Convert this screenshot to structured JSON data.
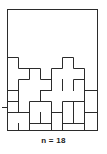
{
  "figure": {
    "caption": "n = 18",
    "kind": "polyomino-packing-diagram",
    "stroke_color": "#2b2b2b",
    "background_color": "#ffffff",
    "frame": {
      "x": 7,
      "y": 9,
      "width": 91,
      "height": 122
    },
    "grid": {
      "cell_width": 11.375,
      "cell_height": 11.0,
      "columns": 8,
      "rows": 11,
      "origin_x": 7,
      "origin_y": 9
    },
    "empty_region": {
      "description": "upper blank area of the rectangle",
      "rows": [
        0,
        4
      ]
    },
    "piece_outlines": [
      "M 7,53 L 18.4,53 L 18.4,64 L 29.8,64 L 29.8,75 L 18.4,75 L 18.4,86 L 7,86 Z",
      "M 29.8,64 L 41.1,64 L 41.1,75 L 52.5,75 L 52.5,86 L 29.8,86 L 29.8,75 Z",
      "M 52.5,53 L 63.9,53 L 63.9,64 L 75.3,64 L 75.3,75 L 63.9,75 L 63.9,86 L 52.5,86 Z",
      "M 75.3,64 L 86.6,64 L 86.6,75 L 98,75 L 98,86 L 75.3,86 Z",
      "M 7,86 L 18.4,86 L 18.4,97 L 29.8,97 L 29.8,108 L 18.4,108 L 18.4,119 L 7,119 Z",
      "M 29.8,86 L 41.1,86 L 41.1,97 L 52.5,97 L 52.5,108 L 41.1,108 L 41.1,119 L 29.8,119 Z",
      "M 52.5,86 L 63.9,86 L 63.9,97 L 75.3,97 L 75.3,108 L 63.9,108 L 63.9,119 L 52.5,119 Z",
      "M 75.3,86 L 86.6,86 L 86.6,97 L 98,97 L 98,119 L 75.3,119 Z",
      "M 7,119 L 29.8,119 L 29.8,131 L 7,131 Z",
      "M 29.8,119 L 52.5,119 L 52.5,131 L 29.8,131 Z",
      "M 52.5,119 L 75.3,119 L 75.3,131 L 52.5,131 Z",
      "M 75.3,119 L 98,119 L 98,131 L 75.3,131 Z"
    ],
    "left_tick": {
      "x1": 2,
      "x2": 7,
      "y": 110
    }
  }
}
